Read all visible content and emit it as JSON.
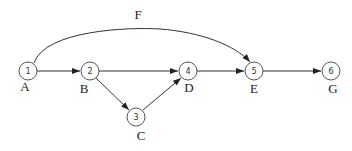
{
  "diagram": {
    "type": "activity-network",
    "nodes": [
      {
        "id": "1",
        "label": "1",
        "activity": "A",
        "x": 28,
        "y": 71
      },
      {
        "id": "2",
        "label": "2",
        "activity": "B",
        "x": 90,
        "y": 71
      },
      {
        "id": "3",
        "label": "3",
        "activity": "C",
        "x": 136,
        "y": 117
      },
      {
        "id": "4",
        "label": "4",
        "activity": "D",
        "x": 188,
        "y": 71
      },
      {
        "id": "5",
        "label": "5",
        "activity": "E",
        "x": 254,
        "y": 71
      },
      {
        "id": "6",
        "label": "6",
        "activity": "G",
        "x": 331,
        "y": 71
      }
    ],
    "edges": [
      {
        "from": "1",
        "to": "2"
      },
      {
        "from": "2",
        "to": "4"
      },
      {
        "from": "2",
        "to": "3"
      },
      {
        "from": "3",
        "to": "4"
      },
      {
        "from": "4",
        "to": "5"
      },
      {
        "from": "5",
        "to": "6"
      },
      {
        "from": "1",
        "to": "5",
        "label": "F",
        "curved": true
      }
    ],
    "curve_label": "F"
  }
}
